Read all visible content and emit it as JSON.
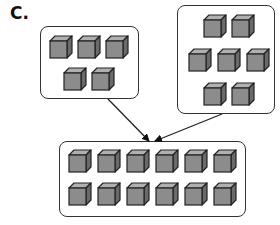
{
  "label": "C.",
  "colors": {
    "cube_front": "#8c8c8c",
    "cube_top": "#b0b0b0",
    "cube_side": "#6a6a6a",
    "outline": "#222222",
    "box_border": "#333333"
  },
  "groups": [
    {
      "name": "group-left",
      "count": 5,
      "box": {
        "x": 40,
        "y": 26,
        "w": 99,
        "h": 73
      },
      "cubes": [
        [
          8,
          8
        ],
        [
          36,
          8
        ],
        [
          64,
          8
        ],
        [
          22,
          40
        ],
        [
          50,
          40
        ]
      ]
    },
    {
      "name": "group-right",
      "count": 7,
      "box": {
        "x": 177,
        "y": 5,
        "w": 98,
        "h": 109
      },
      "cubes": [
        [
          25,
          8
        ],
        [
          53,
          8
        ],
        [
          10,
          42
        ],
        [
          39,
          42
        ],
        [
          68,
          42
        ],
        [
          25,
          76
        ],
        [
          53,
          76
        ]
      ]
    },
    {
      "name": "group-combined",
      "count": 12,
      "box": {
        "x": 59,
        "y": 141,
        "w": 187,
        "h": 76
      },
      "cubes": [
        [
          8,
          7
        ],
        [
          37,
          7
        ],
        [
          66,
          7
        ],
        [
          95,
          7
        ],
        [
          124,
          7
        ],
        [
          153,
          7
        ],
        [
          8,
          40
        ],
        [
          37,
          40
        ],
        [
          66,
          40
        ],
        [
          95,
          40
        ],
        [
          124,
          40
        ],
        [
          153,
          40
        ]
      ]
    }
  ],
  "arrows": [
    {
      "from": [
        108,
        99
      ],
      "to": [
        149,
        141
      ]
    },
    {
      "from": [
        222,
        114
      ],
      "to": [
        155,
        141
      ]
    }
  ]
}
